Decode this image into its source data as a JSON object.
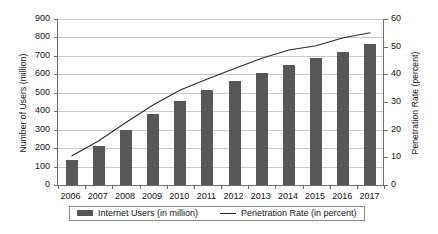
{
  "chart_data": {
    "type": "bar",
    "title": "",
    "categories": [
      "2006",
      "2007",
      "2008",
      "2009",
      "2010",
      "2011",
      "2012",
      "2013",
      "2014",
      "2015",
      "2016",
      "2017"
    ],
    "xlabel": "",
    "ylabel": "Number of Users (million)",
    "y2label": "Penetration Rate (percent)",
    "ylim": [
      0,
      900
    ],
    "y2lim": [
      0,
      60
    ],
    "yticks": [
      "0",
      "100",
      "200",
      "300",
      "400",
      "500",
      "600",
      "700",
      "800",
      "900"
    ],
    "y2ticks": [
      "0",
      "10",
      "20",
      "30",
      "40",
      "50",
      "60"
    ],
    "grid": true,
    "legend_position": "bottom",
    "series": [
      {
        "name": "Internet Users (in million)",
        "type": "bar",
        "axis": "left",
        "color": "#575757",
        "values": [
          137,
          210,
          298,
          384,
          457,
          513,
          564,
          610,
          649,
          688,
          721,
          765
        ]
      },
      {
        "name": "Penetration Rate (in percent)",
        "type": "line",
        "axis": "right",
        "color": "#2b2b2b",
        "values": [
          10.5,
          16.0,
          22.6,
          28.9,
          34.3,
          38.3,
          42.1,
          45.8,
          48.8,
          50.3,
          53.2,
          55.0
        ]
      }
    ]
  },
  "legend": {
    "bar_label": "Internet Users (in million)",
    "line_label": "Penetration Rate (in percent)"
  }
}
